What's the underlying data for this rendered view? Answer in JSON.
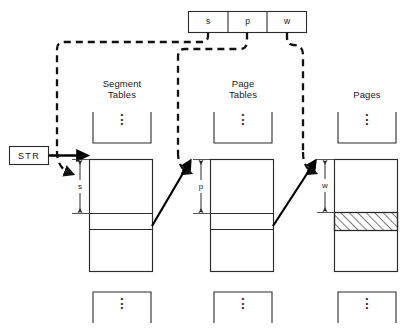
{
  "diagram": {
    "colors": {
      "stroke": "#2b2b2b",
      "thick_stroke": "#000000",
      "dashed": "#111111",
      "hatch": "#1a1a1a",
      "background": "#ffffff",
      "text": "#1a1a1a"
    },
    "register": {
      "name": "virtual-address-register",
      "cells": [
        {
          "label": "s",
          "meaning": "segment-number"
        },
        {
          "label": "p",
          "meaning": "page-number"
        },
        {
          "label": "w",
          "meaning": "word-offset"
        }
      ]
    },
    "base_register": {
      "label": "STR",
      "meaning": "segment-table-register"
    },
    "columns": [
      {
        "key": "segment-tables",
        "title": "Segment\nTables",
        "title_line1": "Segment",
        "title_line2": "Tables",
        "dimension_label": "s",
        "top_dots": "⋮",
        "bottom_dots": "⋮",
        "has_hatched_entry": false
      },
      {
        "key": "page-tables",
        "title": "Page\nTables",
        "title_line1": "Page",
        "title_line2": "Tables",
        "dimension_label": "p",
        "top_dots": "⋮",
        "bottom_dots": "⋮",
        "has_hatched_entry": false
      },
      {
        "key": "pages",
        "title": "Pages",
        "title_line1": "Pages",
        "title_line2": "",
        "dimension_label": "w",
        "top_dots": "⋮",
        "bottom_dots": "⋮",
        "has_hatched_entry": true
      }
    ],
    "dimension_markers": [
      {
        "label": "s",
        "for_column": "segment-tables"
      },
      {
        "label": "p",
        "for_column": "page-tables"
      },
      {
        "label": "w",
        "for_column": "pages"
      }
    ],
    "dashed_links": [
      {
        "from": "register-cell-s",
        "to": "segment-table-offset"
      },
      {
        "from": "register-cell-p",
        "to": "page-table-offset"
      },
      {
        "from": "register-cell-w",
        "to": "page-offset"
      }
    ],
    "solid_links": [
      {
        "from": "segment-table-entry",
        "to": "page-table-base"
      },
      {
        "from": "page-table-entry",
        "to": "page-base"
      }
    ]
  }
}
